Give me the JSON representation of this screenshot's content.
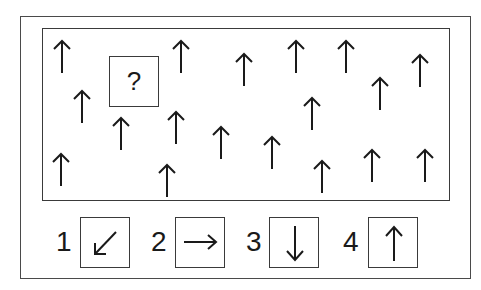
{
  "puzzle": {
    "question_mark": "?",
    "grid_arrows": [
      {
        "x": 62,
        "y": 40,
        "direction": "up"
      },
      {
        "x": 82,
        "y": 90,
        "direction": "up"
      },
      {
        "x": 181,
        "y": 40,
        "direction": "up"
      },
      {
        "x": 121,
        "y": 117,
        "direction": "up"
      },
      {
        "x": 176,
        "y": 111,
        "direction": "up"
      },
      {
        "x": 244,
        "y": 53,
        "direction": "up"
      },
      {
        "x": 296,
        "y": 40,
        "direction": "up"
      },
      {
        "x": 346,
        "y": 40,
        "direction": "up"
      },
      {
        "x": 380,
        "y": 77,
        "direction": "up"
      },
      {
        "x": 420,
        "y": 54,
        "direction": "up"
      },
      {
        "x": 312,
        "y": 97,
        "direction": "up"
      },
      {
        "x": 221,
        "y": 126,
        "direction": "up"
      },
      {
        "x": 61,
        "y": 153,
        "direction": "up"
      },
      {
        "x": 167,
        "y": 164,
        "direction": "up"
      },
      {
        "x": 272,
        "y": 136,
        "direction": "up"
      },
      {
        "x": 322,
        "y": 160,
        "direction": "up"
      },
      {
        "x": 372,
        "y": 149,
        "direction": "up"
      },
      {
        "x": 425,
        "y": 149,
        "direction": "up"
      }
    ]
  },
  "options": [
    {
      "number": "1",
      "direction": "down-left",
      "icon": "arrow-down-left-icon"
    },
    {
      "number": "2",
      "direction": "right",
      "icon": "arrow-right-icon"
    },
    {
      "number": "3",
      "direction": "down",
      "icon": "arrow-down-icon"
    },
    {
      "number": "4",
      "direction": "up",
      "icon": "arrow-up-icon"
    }
  ]
}
